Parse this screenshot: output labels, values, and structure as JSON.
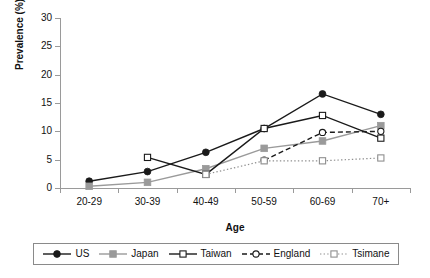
{
  "chart_data": {
    "type": "line",
    "title": "",
    "xlabel": "Age",
    "ylabel": "Prevalence (%)",
    "categories": [
      "20-29",
      "30-39",
      "40-49",
      "50-59",
      "60-69",
      "70+"
    ],
    "ylim": [
      0,
      30
    ],
    "yticks": [
      0,
      5,
      10,
      15,
      20,
      25,
      30
    ],
    "ytick_labels": [
      "0",
      "5",
      "10",
      "15",
      "20",
      "25",
      "30"
    ],
    "grid": false,
    "legend_position": "bottom",
    "series": [
      {
        "name": "US",
        "color": "#1a1a1a",
        "line_style": "solid",
        "marker": "filled-circle",
        "x": [
          "20-29",
          "30-39",
          "40-49",
          "50-59",
          "60-69",
          "70+"
        ],
        "values": [
          1.2,
          2.9,
          6.3,
          10.5,
          16.6,
          13.0
        ]
      },
      {
        "name": "Japan",
        "color": "#9a9a9a",
        "line_style": "solid",
        "marker": "filled-square",
        "x": [
          "20-29",
          "30-39",
          "40-49",
          "50-59",
          "60-69",
          "70+"
        ],
        "values": [
          0.3,
          1.0,
          3.4,
          7.0,
          8.3,
          11.0
        ]
      },
      {
        "name": "Taiwan",
        "color": "#1a1a1a",
        "line_style": "solid",
        "marker": "open-square",
        "x": [
          "30-39",
          "40-49",
          "50-59",
          "60-69",
          "70+"
        ],
        "values": [
          5.4,
          2.4,
          10.5,
          12.8,
          8.8
        ]
      },
      {
        "name": "England",
        "color": "#1a1a1a",
        "line_style": "dashed",
        "marker": "open-circle",
        "x": [
          "50-59",
          "60-69",
          "70+"
        ],
        "values": [
          4.9,
          9.8,
          10.0
        ]
      },
      {
        "name": "Tsimane",
        "color": "#8f8f8f",
        "line_style": "dotted",
        "marker": "open-square",
        "x": [
          "40-49",
          "50-59",
          "60-69",
          "70+"
        ],
        "values": [
          2.4,
          4.8,
          4.8,
          5.3
        ]
      }
    ]
  },
  "legend": {
    "items": [
      {
        "label": "US"
      },
      {
        "label": "Japan"
      },
      {
        "label": "Taiwan"
      },
      {
        "label": "England"
      },
      {
        "label": "Tsimane"
      }
    ]
  }
}
